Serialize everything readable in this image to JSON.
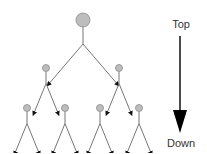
{
  "diagram": {
    "type": "binary-tree-top-down",
    "direction_indicator": {
      "top_label": "Top",
      "bottom_label": "Down",
      "icon": "arrow-down-icon"
    },
    "tree": {
      "levels": 3,
      "node_color": "#bdbdbd",
      "node_stroke": "#8a8a8a",
      "edge_color": "#777777",
      "arrow_color": "#111111",
      "nodes": [
        {
          "id": "root",
          "level": 0,
          "children": [
            "l1a",
            "l1b"
          ]
        },
        {
          "id": "l1a",
          "level": 1,
          "children": [
            "l2a",
            "l2b"
          ]
        },
        {
          "id": "l1b",
          "level": 1,
          "children": [
            "l2c",
            "l2d"
          ]
        },
        {
          "id": "l2a",
          "level": 2,
          "children": []
        },
        {
          "id": "l2b",
          "level": 2,
          "children": []
        },
        {
          "id": "l2c",
          "level": 2,
          "children": []
        },
        {
          "id": "l2d",
          "level": 2,
          "children": []
        }
      ]
    }
  }
}
